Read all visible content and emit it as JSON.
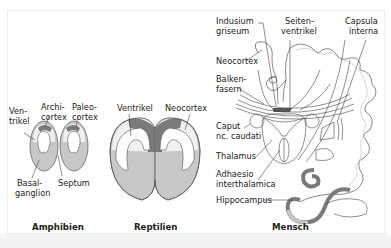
{
  "panels": [
    {
      "title": "Amphibien",
      "labels": [
        "Ven-",
        "trikel",
        "Archi-",
        "cortex",
        "Paleo-",
        "cortex",
        "Basal-",
        "ganglion",
        "Septum"
      ]
    },
    {
      "title": "Reptilien",
      "labels": [
        "Ventrikel",
        "Neocortex"
      ]
    },
    {
      "title": "Mensch",
      "labels": [
        "Indusium",
        "griseum",
        "Seiten-",
        "ventrikel",
        "Capsula",
        "interna",
        "Neocortex",
        "Balken-",
        "fasern",
        "Caput",
        "nc. caudati",
        "Thalamus",
        "Adhaesio",
        "interthalamica",
        "Hippocampus"
      ]
    }
  ],
  "colors": {
    "light": "#f0f0f0",
    "mid": "#c8c8c8",
    "dark": "#7a7a7a",
    "outline": "#555555"
  }
}
